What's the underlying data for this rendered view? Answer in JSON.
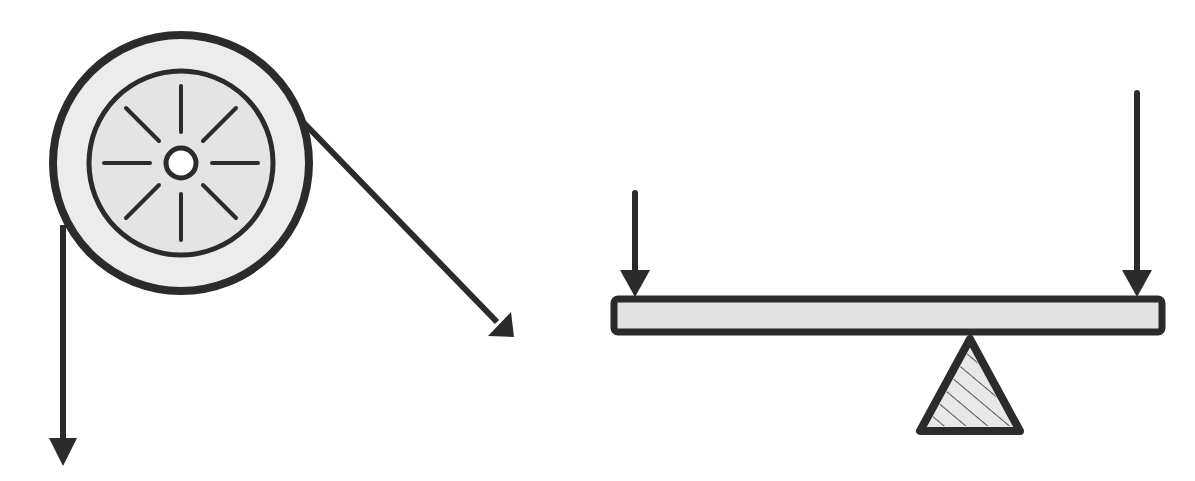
{
  "diagram": {
    "colors": {
      "stroke": "#2b2b2b",
      "fill_light": "#e6e6e6",
      "fill_wheel": "#ececec",
      "hub_fill": "#ffffff",
      "background": "#ffffff"
    },
    "pulley": {
      "label": "pulley",
      "center": [
        181,
        163
      ],
      "outer_radius": 128,
      "inner_radius": 92,
      "hub_radius": 14,
      "spokes": 8,
      "forces": [
        {
          "name": "left-rope-force",
          "direction": "down"
        },
        {
          "name": "right-rope-force",
          "direction": "down-right"
        }
      ]
    },
    "lever": {
      "label": "lever",
      "beam": {
        "x": 612,
        "y": 297,
        "width": 552,
        "height": 36
      },
      "fulcrum": {
        "apex": [
          970,
          337
        ],
        "base_left": [
          918,
          433
        ],
        "base_right": [
          1022,
          433
        ],
        "pattern": "hatched"
      },
      "forces": [
        {
          "name": "left-load-force",
          "x": 635,
          "from_y": 193,
          "to_y": 297
        },
        {
          "name": "right-effort-force",
          "x": 1137,
          "from_y": 93,
          "to_y": 297
        }
      ]
    }
  }
}
